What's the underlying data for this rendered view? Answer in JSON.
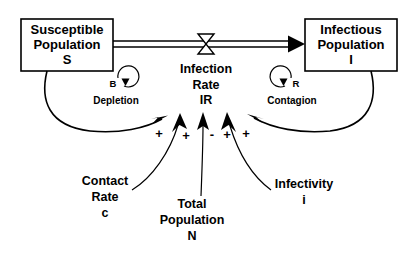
{
  "diagram": {
    "type": "system-dynamics-stock-and-flow",
    "stocks": [
      {
        "id": "susceptible",
        "lines": [
          "Susceptible",
          "Population",
          "S"
        ],
        "line1": "Susceptible",
        "line2": "Population",
        "line3": "S"
      },
      {
        "id": "infectious",
        "lines": [
          "Infectious",
          "Population",
          "I"
        ],
        "line1": "Infectious",
        "line2": "Population",
        "line3": "I"
      }
    ],
    "flow": {
      "id": "infection-rate",
      "line1": "Infection",
      "line2": "Rate",
      "line3": "IR",
      "valve_shape": "bowtie"
    },
    "auxiliaries": [
      {
        "id": "contact-rate",
        "line1": "Contact",
        "line2": "Rate",
        "line3": "c"
      },
      {
        "id": "total-population",
        "line1": "Total",
        "line2": "Population",
        "line3": "N"
      },
      {
        "id": "infectivity",
        "line1": "Infectivity",
        "line2": "i",
        "line3": ""
      }
    ],
    "loops": [
      {
        "id": "balancing-loop",
        "letter": "B",
        "name": "Depletion",
        "polarity": "balancing"
      },
      {
        "id": "reinforcing-loop",
        "letter": "R",
        "name": "Contagion",
        "polarity": "reinforcing"
      }
    ],
    "link_signs": [
      {
        "id": "sign-susceptible",
        "symbol": "+",
        "source": "Susceptible Population S"
      },
      {
        "id": "sign-contact-rate",
        "symbol": "+",
        "source": "Contact Rate c"
      },
      {
        "id": "sign-total-population",
        "symbol": "-",
        "source": "Total Population N"
      },
      {
        "id": "sign-infectivity",
        "symbol": "+",
        "source": "Infectivity i"
      },
      {
        "id": "sign-infectious",
        "symbol": "+",
        "source": "Infectious Population I"
      }
    ],
    "colors": {
      "stroke": "#000000",
      "background": "#ffffff",
      "text": "#000000"
    }
  }
}
